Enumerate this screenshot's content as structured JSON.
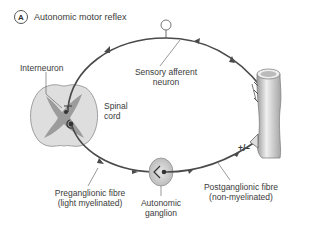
{
  "figure": {
    "panel_letter": "A",
    "title": "Autonomic motor reflex"
  },
  "labels": {
    "interneuron": "Interneuron",
    "spinal_cord_1": "Spinal",
    "spinal_cord_2": "cord",
    "sensory_1": "Sensory afferent",
    "sensory_2": "neuron",
    "pre_1": "Preganglionic fibre",
    "pre_2": "(light myelinated)",
    "ganglion_1": "Autonomic",
    "ganglion_2": "ganglion",
    "post_1": "Postganglionic fibre",
    "post_2": "(non-myelinated)",
    "sign": "+/–"
  },
  "colors": {
    "pathway": "#4a4a4a",
    "grey_matter": "#9a9a9a",
    "white_matter": "#dcdcdc",
    "ganglion": "#c8c8c8",
    "vessel": "#bdbdbd"
  }
}
